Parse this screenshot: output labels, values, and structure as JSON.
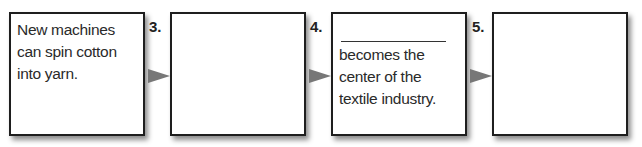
{
  "diagram": {
    "type": "flow-chain",
    "boxes": [
      {
        "number": "",
        "text": "New machines can spin cotton into yarn.",
        "has_blank": false
      },
      {
        "number": "3.",
        "text": "",
        "has_blank": false
      },
      {
        "number": "4.",
        "text": "becomes the center of the textile industry.",
        "has_blank": true
      },
      {
        "number": "5.",
        "text": "",
        "has_blank": false
      }
    ],
    "arrow_color": "#777777",
    "border_color": "#1e1e1e"
  }
}
